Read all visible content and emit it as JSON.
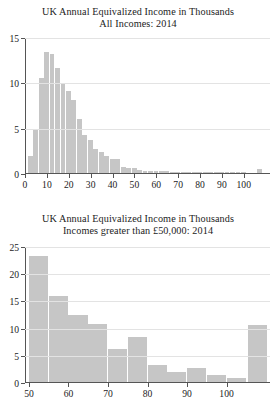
{
  "chart_data": [
    {
      "id": "all-incomes-2014",
      "type": "bar",
      "title": "UK Annual Equivalized Income in Thousands",
      "subtitle": "All Incomes: 2014",
      "xlabel": "",
      "ylabel": "",
      "xlim": [
        0,
        112
      ],
      "ylim": [
        0,
        15
      ],
      "grid": true,
      "bin_width": 2.5,
      "bar_color": "#c6c6c6",
      "legend": "none",
      "xticks": [
        0,
        10,
        20,
        30,
        40,
        50,
        60,
        70,
        80,
        90,
        100
      ],
      "yticks": [
        0,
        5,
        10,
        15
      ],
      "x": [
        2.5,
        5.0,
        7.5,
        10.0,
        12.5,
        15.0,
        17.5,
        20.0,
        22.5,
        25.0,
        27.5,
        30.0,
        32.5,
        35.0,
        37.5,
        40.0,
        42.5,
        45.0,
        47.5,
        50.0,
        52.5,
        55.0,
        57.5,
        60.0,
        62.5,
        65.0,
        67.5,
        70.0,
        72.5,
        75.0,
        77.5,
        80.0,
        82.5,
        85.0,
        87.5,
        90.0,
        92.5,
        95.0,
        97.5,
        100.0,
        102.5,
        105.0,
        107.5
      ],
      "values": [
        1.9,
        4.7,
        10.5,
        13.3,
        13.1,
        11.6,
        9.9,
        9.0,
        8.1,
        6.0,
        4.2,
        3.6,
        2.7,
        2.3,
        1.9,
        1.6,
        1.5,
        0.7,
        0.6,
        0.5,
        0.35,
        0.25,
        0.2,
        0.2,
        0.2,
        0.2,
        0.08,
        0.07,
        0.06,
        0.05,
        0.05,
        0.04,
        0.04,
        0.03,
        0.03,
        0.03,
        0.02,
        0.02,
        0.02,
        0.02,
        0.0,
        0.0,
        0.45
      ]
    },
    {
      "id": "incomes-above-50k-2014",
      "type": "bar",
      "title": "UK Annual Equivalized Income in Thousands",
      "subtitle": "Incomes greater than £50,000: 2014",
      "xlabel": "",
      "ylabel": "",
      "xlim": [
        49,
        111
      ],
      "ylim": [
        0,
        25
      ],
      "grid": true,
      "bin_width": 5,
      "bar_color": "#c6c6c6",
      "legend": "none",
      "xticks": [
        50,
        60,
        70,
        80,
        90,
        100
      ],
      "yticks": [
        0,
        5,
        10,
        15,
        20,
        25
      ],
      "x": [
        52.5,
        57.5,
        62.5,
        67.5,
        72.5,
        77.5,
        82.5,
        87.5,
        92.5,
        97.5,
        102.5,
        108.0
      ],
      "values": [
        23.1,
        15.8,
        12.4,
        10.7,
        6.0,
        8.3,
        3.1,
        1.9,
        2.5,
        1.3,
        0.7,
        10.4
      ]
    }
  ],
  "figures": [
    {
      "title_line1": "UK Annual Equivalized Income in Thousands",
      "title_line2": "All Incomes: 2014"
    },
    {
      "title_line1": "UK Annual Equivalized Income in Thousands",
      "title_line2": "Incomes greater than £50,000: 2014"
    }
  ]
}
